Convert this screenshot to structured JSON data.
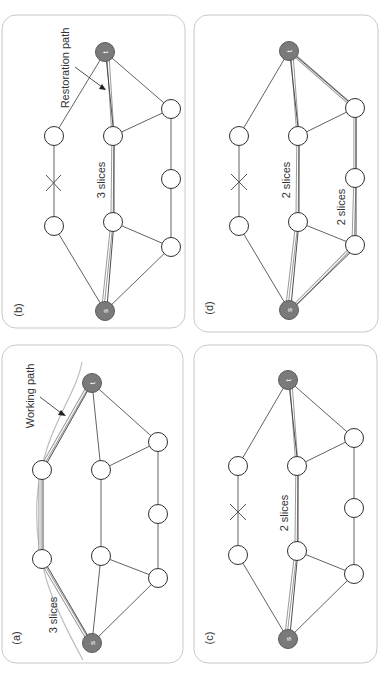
{
  "figure": {
    "orientation": "rotated-90-ccw",
    "colors": {
      "terminal_node": "#7a7a7a",
      "path_highlight": "#9a9a9a",
      "edge": "#3a3a3a",
      "frame": "#c9c9c9"
    },
    "panels": [
      {
        "id": "a",
        "label": "(a)",
        "annotations": [
          {
            "text": "3 slices"
          },
          {
            "text": "Working path"
          }
        ],
        "failed_link": false
      },
      {
        "id": "b",
        "label": "(b)",
        "annotations": [
          {
            "text": "3 slices"
          },
          {
            "text": "Restoration path"
          }
        ],
        "failed_link": true
      },
      {
        "id": "c",
        "label": "(c)",
        "annotations": [
          {
            "text": "2 slices"
          }
        ],
        "failed_link": true
      },
      {
        "id": "d",
        "label": "(d)",
        "annotations": [
          {
            "text": "2 slices"
          },
          {
            "text": "2 slices"
          }
        ],
        "failed_link": true
      }
    ],
    "nodes": {
      "source": "s",
      "target": "t"
    }
  }
}
